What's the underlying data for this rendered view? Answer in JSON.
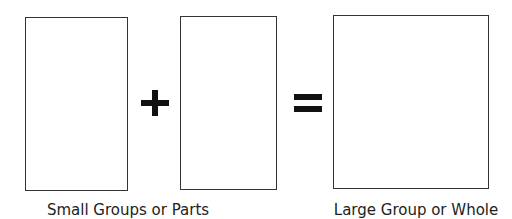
{
  "diagram": {
    "parts": [
      {
        "shape": "rectangle",
        "role": "part"
      },
      {
        "shape": "rectangle",
        "role": "part"
      }
    ],
    "whole": {
      "shape": "rectangle",
      "role": "whole"
    },
    "operators": {
      "plus": "+",
      "equals": "="
    },
    "labels": {
      "parts": "Small Groups or Parts",
      "whole": "Large Group or Whole"
    },
    "colors": {
      "stroke": "#333333",
      "operator": "#111111",
      "text": "#222222",
      "background": "#ffffff"
    }
  }
}
